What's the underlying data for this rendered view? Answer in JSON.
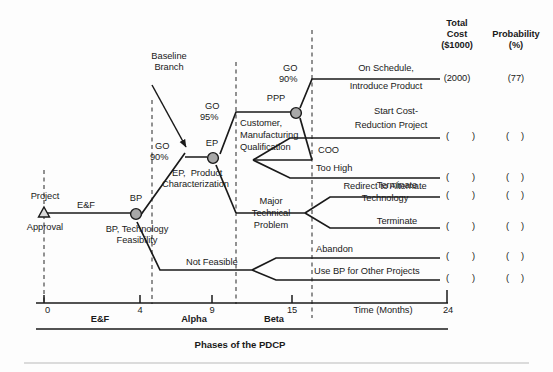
{
  "diagram": {
    "title_bottom": "Phases of the PDCP",
    "axis_title": "Time (Months)",
    "axis_ticks": [
      "0",
      "4",
      "9",
      "15",
      "24"
    ],
    "phases": [
      "E&F",
      "Alpha",
      "Beta"
    ],
    "columns": {
      "cost_h1": "Total",
      "cost_h2": "Cost",
      "cost_h3": "($1000)",
      "prob_h1": "Probability",
      "prob_h2": "(%)"
    },
    "annotations": {
      "baseline_1": "Baseline",
      "baseline_2": "Branch"
    },
    "nodes": [
      {
        "id": "approval",
        "label_above": "Project",
        "label_below": "Approval",
        "shape": "triangle"
      },
      {
        "id": "bp",
        "label_above": "BP",
        "label_below_1": "BP, Technology",
        "label_below_2": "Feasibility",
        "shape": "circle"
      },
      {
        "id": "ep",
        "label_above": "EP",
        "label_below_1": "EP,  Product",
        "label_below_2": "Characterization",
        "shape": "circle"
      },
      {
        "id": "ppp",
        "label_above": "PPP",
        "label_below_1": "Customer,",
        "label_below_2": "Manufacturing",
        "label_below_3": "Qualification",
        "shape": "circle"
      }
    ],
    "branch_labels": [
      {
        "id": "ef",
        "text": "E&F"
      },
      {
        "id": "go90a_1",
        "text": "GO"
      },
      {
        "id": "go90a_2",
        "text": "90%"
      },
      {
        "id": "go95_1",
        "text": "GO"
      },
      {
        "id": "go95_2",
        "text": "95%"
      },
      {
        "id": "go90b_1",
        "text": "GO"
      },
      {
        "id": "go90b_2",
        "text": "90%"
      },
      {
        "id": "coo",
        "text": "COO"
      },
      {
        "id": "too_high",
        "text": "Too High"
      },
      {
        "id": "not_feasible",
        "text": "Not Feasible"
      },
      {
        "id": "major_1",
        "text": "Major"
      },
      {
        "id": "major_2",
        "text": "Technical"
      },
      {
        "id": "major_3",
        "text": "Problem"
      }
    ],
    "outcomes": [
      {
        "id": "on-schedule",
        "line1": "On Schedule,",
        "line2": "Introduce Product",
        "cost": "(2000)",
        "prob": "(77)"
      },
      {
        "id": "cost-reduction",
        "line1": "Start Cost-",
        "line2": "Reduction Project",
        "cost_open": "(",
        "cost_close": ")",
        "prob_open": "(",
        "prob_close": ")"
      },
      {
        "id": "terminate-coo",
        "line1": "Terminate",
        "cost_open": "(",
        "cost_close": ")",
        "prob_open": "(",
        "prob_close": ")"
      },
      {
        "id": "redirect",
        "line1": "Redirect to Alternate",
        "line2": "Technology",
        "cost_open": "(",
        "cost_close": ")",
        "prob_open": "(",
        "prob_close": ")"
      },
      {
        "id": "terminate-major",
        "line1": "Terminate",
        "cost_open": "(",
        "cost_close": ")",
        "prob_open": "(",
        "prob_close": ")"
      },
      {
        "id": "abandon",
        "line1": "Abandon",
        "cost_open": "(",
        "cost_close": ")",
        "prob_open": "(",
        "prob_close": ")"
      },
      {
        "id": "use-bp",
        "line1": "Use BP for Other Projects",
        "cost_open": "(",
        "cost_close": ")",
        "prob_open": "(",
        "prob_close": ")"
      }
    ],
    "colors": {
      "line": "#1a1a1a",
      "node_fill": "#a8a8a8",
      "dashed": "#3a3a3a",
      "text": "#1a1a1a",
      "rule": "#b9b9b9"
    }
  }
}
